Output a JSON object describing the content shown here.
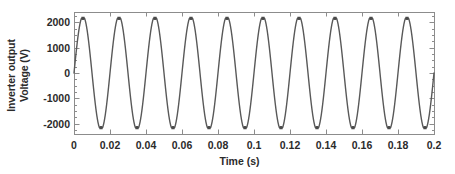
{
  "chart_data": {
    "type": "line",
    "title": "",
    "xlabel": "Time (s)",
    "ylabel_line1": "Inverter output",
    "ylabel_line2": "Voltage (V)",
    "xlim": [
      0,
      0.2
    ],
    "ylim": [
      -2400,
      2400
    ],
    "xticks": [
      0,
      0.02,
      0.04,
      0.06,
      0.08,
      0.1,
      0.12,
      0.14,
      0.16,
      0.18,
      0.2
    ],
    "xtick_labels": [
      "0",
      "0.02",
      "0.04",
      "0.06",
      "0.08",
      "0.1",
      "0.12",
      "0.14",
      "0.16",
      "0.18",
      "0.2"
    ],
    "yticks": [
      2000,
      1000,
      0,
      -1000,
      -2000
    ],
    "ytick_labels": [
      "2000",
      "1000",
      "0",
      "-1000",
      "-2000"
    ],
    "y_minor_tick_step": 250,
    "grid": false,
    "legend": null,
    "series": [
      {
        "name": "Inverter output voltage",
        "color": "#595959",
        "line_width": 1.4,
        "waveform": "clipped-sine",
        "frequency_hz": 50,
        "cycles_shown": 10,
        "peak_value": 2150,
        "trough_value": -2150,
        "clip_level": 2150,
        "clip_fraction_of_halfcycle": 0.09,
        "phase_deg": 0,
        "samples_per_cycle": 240
      }
    ],
    "axes_box": {
      "left_px": 74,
      "right_px": 434,
      "top_px": 12,
      "bottom_px": 134,
      "frame_color": "#8c8c8c",
      "frame_width": 1
    }
  }
}
